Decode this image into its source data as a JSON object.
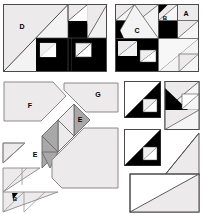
{
  "figure": {
    "type": "quilt-block-assembly-diagram",
    "colors": {
      "light": "#eceaea",
      "light_alt": "#e6e4e4",
      "dark": "#000000",
      "gray": "#a8a8a8",
      "outline": "#4a4a4a",
      "white": "#ffffff",
      "background": "#ffffff",
      "label": "#000000"
    },
    "labels": [
      {
        "id": "D",
        "text": "D",
        "x": 22,
        "y": 27,
        "panel": "top-left"
      },
      {
        "id": "C",
        "text": "C",
        "x": 137,
        "y": 30,
        "panel": "top-right"
      },
      {
        "id": "B_top",
        "text": "B",
        "x": 165,
        "y": 18,
        "panel": "top-right"
      },
      {
        "id": "A",
        "text": "A",
        "x": 184,
        "y": 14,
        "panel": "top-right"
      },
      {
        "id": "F",
        "text": "F",
        "x": 30,
        "y": 106,
        "panel": "bottom-left"
      },
      {
        "id": "G",
        "text": "G",
        "x": 98,
        "y": 95,
        "panel": "bottom-left"
      },
      {
        "id": "E1",
        "text": "E",
        "x": 80,
        "y": 120,
        "panel": "bottom-left"
      },
      {
        "id": "E2",
        "text": "E",
        "x": 35,
        "y": 155,
        "panel": "bottom-left"
      },
      {
        "id": "B_bottom",
        "text": "B",
        "x": 16,
        "y": 198,
        "panel": "bottom-left"
      }
    ],
    "panels": [
      {
        "name": "panel-d",
        "label": "D",
        "x": 3,
        "y": 4,
        "w": 104,
        "h": 68,
        "description": "Large pieced block with half-square triangle units"
      },
      {
        "name": "panel-c",
        "label": "C",
        "x": 115,
        "y": 4,
        "w": 84,
        "h": 68,
        "description": "Pieced block with labels C, B and A"
      },
      {
        "name": "panel-exploded",
        "label": "F G E B",
        "x": 2,
        "y": 78,
        "w": 118,
        "h": 134,
        "description": "Exploded layout of template pieces F, G, E, E and B"
      },
      {
        "name": "panel-units-right",
        "label": "",
        "x": 122,
        "y": 80,
        "w": 78,
        "h": 132,
        "description": "Individual half-square triangle units and plain triangles"
      }
    ],
    "piece_list": [
      "A",
      "B",
      "C",
      "D",
      "E",
      "F",
      "G"
    ]
  }
}
